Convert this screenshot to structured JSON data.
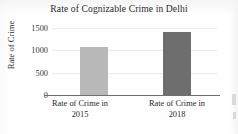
{
  "chart_data": {
    "type": "bar",
    "title": "Rate of Cognizable Crime in Delhi",
    "xlabel": "",
    "ylabel": "Rate of Crime",
    "categories": [
      "Rate of Crime in 2015",
      "Rate of Crime in 2018"
    ],
    "category_lines": [
      {
        "line1": "Rate of Crime in",
        "line2": "2015"
      },
      {
        "line1": "Rate of Crime in",
        "line2": "2018"
      }
    ],
    "values": [
      1075,
      1410
    ],
    "ylim": [
      0,
      1500
    ],
    "yticks": [
      "0",
      "500",
      "1000",
      "1500"
    ],
    "ytick_values": [
      0,
      500,
      1000,
      1500
    ],
    "grid": true,
    "legend": "none",
    "bar_colors": [
      "#b9b9b9",
      "#6e6e6e"
    ]
  },
  "figure": {
    "background_color": "#fefefe",
    "axis_color": "#6f6f6f",
    "grid_color": "#ececec",
    "text_color": "#2b2b2b"
  }
}
